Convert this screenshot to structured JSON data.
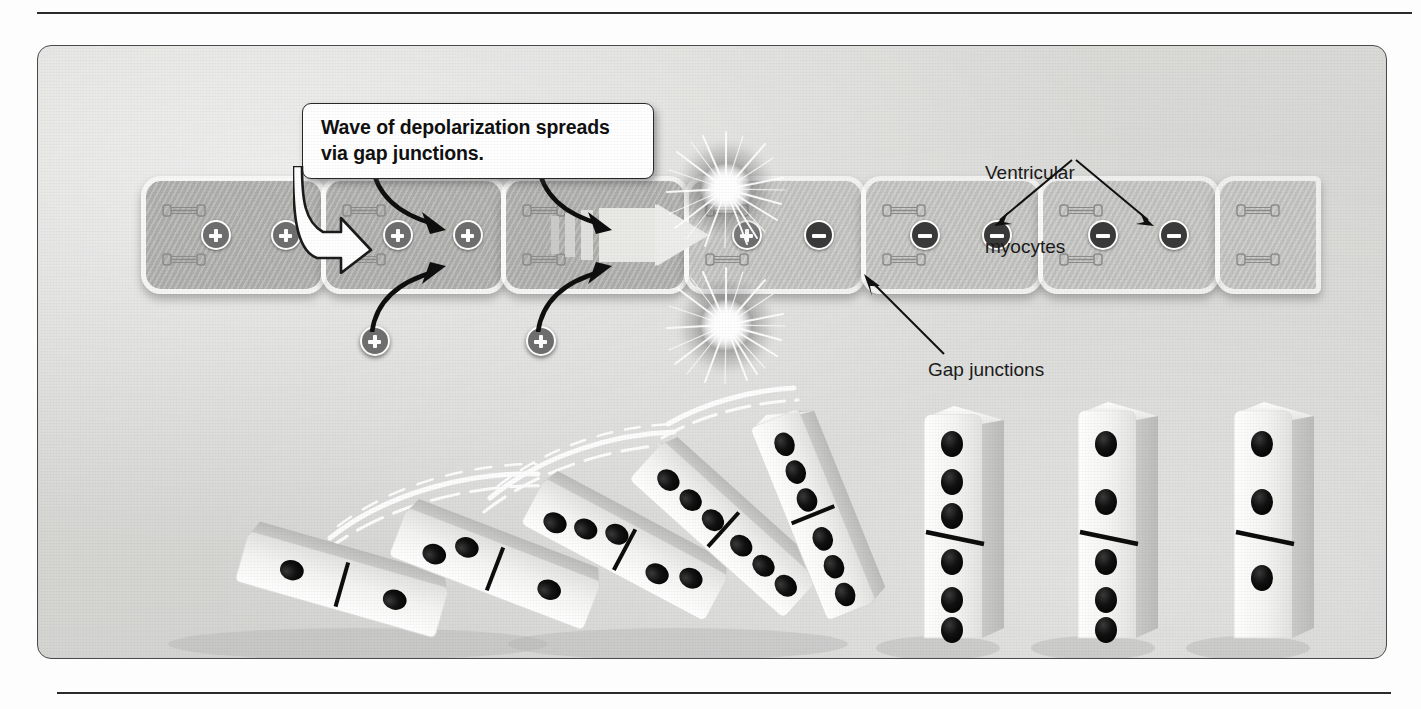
{
  "figure": {
    "panel_bg": "#d7d7d5"
  },
  "callout": {
    "line1": "Wave of depolarization spreads",
    "line2": "via gap junctions.",
    "text": "Wave of depolarization spreads via gap junctions."
  },
  "labels": {
    "ventricular_myocytes_line1": "Ventricular",
    "ventricular_myocytes_line2": "myocytes",
    "ventricular_myocytes": "Ventricular myocytes",
    "gap_junctions": "Gap junctions"
  },
  "colors": {
    "panel_fill": "#d7d7d5",
    "cell_depolarized": "#b2b2b0",
    "cell_resting": "#c6c6c4",
    "membrane": "#ffffff",
    "plus_badge": "#6f6f6f",
    "minus_badge": "#3b3b3b",
    "outline": "#2a2a2a",
    "domino_white": "#f2f2f0",
    "domino_pip": "#141414"
  },
  "cells": [
    {
      "index": 1,
      "state": "depolarized",
      "charges": [
        "+",
        "+"
      ]
    },
    {
      "index": 2,
      "state": "depolarized",
      "charges": [
        "+",
        "+"
      ]
    },
    {
      "index": 3,
      "state": "depolarizing",
      "charges": [],
      "wave_arrow": true
    },
    {
      "index": 4,
      "state": "transition",
      "charges": [
        "+",
        "-"
      ],
      "sparks": 2
    },
    {
      "index": 5,
      "state": "resting",
      "charges": [
        "-",
        "-"
      ]
    },
    {
      "index": 6,
      "state": "resting",
      "charges": [
        "-",
        "-"
      ]
    },
    {
      "index": 7,
      "state": "resting",
      "charges": []
    }
  ],
  "free_charges": [
    {
      "sign": "+",
      "position": "above",
      "target_cell": 2
    },
    {
      "sign": "+",
      "position": "below",
      "target_cell": 2
    },
    {
      "sign": "+",
      "position": "above",
      "target_cell": 3
    },
    {
      "sign": "+",
      "position": "below",
      "target_cell": 3
    }
  ],
  "gap_junction_count": 7,
  "icons": {
    "plus": "plus-charge-icon",
    "minus": "minus-charge-icon",
    "gap_junction": "gap-junction-icon",
    "spark": "spark-burst-icon",
    "wave_arrow": "wave-arrow-icon",
    "callout_arrow": "callout-pointer-arrow-icon"
  },
  "dominoes": {
    "count": 8,
    "fallen": 5,
    "standing": 3,
    "motion_streaks": 3,
    "items": [
      {
        "index": 1,
        "state": "fallen",
        "angle": -74,
        "pips_top": 1,
        "pips_bottom": 1
      },
      {
        "index": 2,
        "state": "fallen",
        "angle": -69,
        "pips_top": 2,
        "pips_bottom": 1
      },
      {
        "index": 3,
        "state": "fallen",
        "angle": -62,
        "pips_top": 3,
        "pips_bottom": 2
      },
      {
        "index": 4,
        "state": "toppling",
        "angle": -48,
        "pips_top": 3,
        "pips_bottom": 3
      },
      {
        "index": 5,
        "state": "toppling",
        "angle": -22,
        "pips_top": 3,
        "pips_bottom": 3
      },
      {
        "index": 6,
        "state": "standing",
        "angle": 0,
        "pips_top": 3,
        "pips_bottom": 3
      },
      {
        "index": 7,
        "state": "standing",
        "angle": 0,
        "pips_top": 2,
        "pips_bottom": 3
      },
      {
        "index": 8,
        "state": "standing",
        "angle": 0,
        "pips_top": 2,
        "pips_bottom": 1
      }
    ]
  }
}
